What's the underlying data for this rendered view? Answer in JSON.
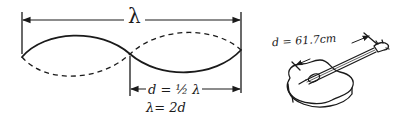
{
  "diagram": {
    "wavelength_label": "λ",
    "half_wavelength_equation": "d = ½ λ",
    "wavelength_equation": "λ= 2d",
    "guitar_length_label": "d = 61.7cm",
    "wave": {
      "solid_style": "solid",
      "dashed_style": "dashed",
      "nodes": 3,
      "loops_shown": 2
    },
    "colors": {
      "ink": "#1a1a1a",
      "background": "#ffffff"
    },
    "icons": {
      "guitar": "acoustic-guitar-sketch",
      "arrow": "dimension-arrow"
    }
  }
}
